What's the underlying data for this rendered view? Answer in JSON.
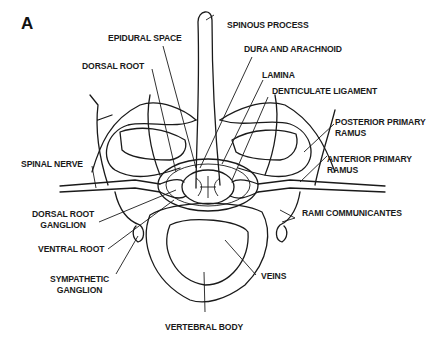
{
  "figure": {
    "panel_label": "A",
    "labels": {
      "spinous_process": "SPINOUS PROCESS",
      "epidural_space": "EPIDURAL SPACE",
      "dura_and_arachnoid": "DURA AND ARACHNOID",
      "dorsal_root": "DORSAL ROOT",
      "lamina": "LAMINA",
      "denticulate_ligament": "DENTICULATE LIGAMENT",
      "posterior_primary_ramus_1": "POSTERIOR PRIMARY",
      "posterior_primary_ramus_2": "RAMUS",
      "anterior_primary_ramus_1": "ANTERIOR PRIMARY",
      "anterior_primary_ramus_2": "RAMUS",
      "spinal_nerve": "SPINAL NERVE",
      "dorsal_root_ganglion_1": "DORSAL ROOT",
      "dorsal_root_ganglion_2": "GANGLION",
      "rami_communicantes": "RAMI COMMUNICANTES",
      "ventral_root": "VENTRAL ROOT",
      "sympathetic_ganglion_1": "SYMPATHETIC",
      "sympathetic_ganglion_2": "GANGLION",
      "veins": "VEINS",
      "vertebral_body": "VERTEBRAL BODY"
    }
  }
}
